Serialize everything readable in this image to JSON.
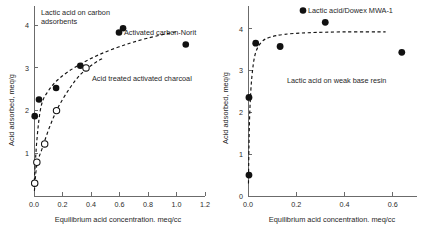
{
  "figure": {
    "panel_count": 2
  },
  "chart_data": [
    {
      "type": "scatter",
      "id": "left-panel",
      "title": "",
      "annotations": [
        {
          "id": "panel-title",
          "text_line1": "Lactic acid on carbon",
          "text_line2": "adsorbents"
        },
        {
          "id": "series-norit-label",
          "text": "Activated carbon-Norit"
        },
        {
          "id": "series-charcoal-label",
          "text": "Acid treated activated charcoal"
        }
      ],
      "xlabel": "Equilibrium acid concentration. meq/cc",
      "ylabel": "Acid adsorbed, meq/g",
      "xlim": [
        0.0,
        1.2
      ],
      "ylim": [
        0.0,
        4.45
      ],
      "xticks": [
        0.0,
        0.2,
        0.4,
        0.6,
        0.8,
        1.0,
        1.2
      ],
      "xticklabels": [
        "0.0",
        "0.2",
        "0.4",
        "0.6",
        "0.8",
        "1.0",
        "1.2"
      ],
      "yticks": [
        1,
        2,
        3,
        4
      ],
      "yticklabels": [
        "1",
        "2",
        "3",
        "4"
      ],
      "grid": false,
      "legend": "annotation-labels",
      "series": [
        {
          "name": "Activated carbon-Norit",
          "marker": "filled-circle",
          "color": "#111111",
          "points": [
            {
              "x": 0.005,
              "y": 0.3
            },
            {
              "x": 0.005,
              "y": 1.87
            },
            {
              "x": 0.035,
              "y": 2.26
            },
            {
              "x": 0.155,
              "y": 2.53
            },
            {
              "x": 0.325,
              "y": 3.05
            },
            {
              "x": 0.625,
              "y": 3.93
            },
            {
              "x": 1.065,
              "y": 3.55
            }
          ],
          "fit_curve": [
            {
              "x": 0.0,
              "y": 0.22
            },
            {
              "x": 0.02,
              "y": 1.3
            },
            {
              "x": 0.05,
              "y": 2.1
            },
            {
              "x": 0.1,
              "y": 2.46
            },
            {
              "x": 0.18,
              "y": 2.76
            },
            {
              "x": 0.3,
              "y": 3.04
            },
            {
              "x": 0.45,
              "y": 3.3
            },
            {
              "x": 0.62,
              "y": 3.52
            },
            {
              "x": 0.8,
              "y": 3.7
            },
            {
              "x": 1.0,
              "y": 3.85
            }
          ]
        },
        {
          "name": "Acid treated activated charcoal",
          "marker": "open-circle",
          "color": "#111111",
          "points": [
            {
              "x": 0.005,
              "y": 0.3
            },
            {
              "x": 0.02,
              "y": 0.79
            },
            {
              "x": 0.075,
              "y": 1.22
            },
            {
              "x": 0.158,
              "y": 2.0
            },
            {
              "x": 0.365,
              "y": 3.0
            }
          ],
          "fit_curve": [
            {
              "x": 0.003,
              "y": 0.12
            },
            {
              "x": 0.02,
              "y": 0.72
            },
            {
              "x": 0.06,
              "y": 1.14
            },
            {
              "x": 0.11,
              "y": 1.62
            },
            {
              "x": 0.17,
              "y": 2.08
            },
            {
              "x": 0.25,
              "y": 2.52
            },
            {
              "x": 0.33,
              "y": 2.86
            },
            {
              "x": 0.42,
              "y": 3.1
            },
            {
              "x": 0.48,
              "y": 3.22
            }
          ]
        }
      ]
    },
    {
      "type": "scatter",
      "id": "right-panel",
      "title": "",
      "annotations": [
        {
          "id": "series-dowex-label",
          "text": "Lactic acid/Dowex MWA-1"
        },
        {
          "id": "panel-subtitle",
          "text": "Lactic acid on weak base resin"
        }
      ],
      "xlabel": "Equilibrium acid concentration. meq/cc",
      "ylabel": "Acid adsorbed, meq/g",
      "xlim": [
        0.0,
        0.7
      ],
      "ylim": [
        0.0,
        4.55
      ],
      "xticks": [
        0.0,
        0.2,
        0.4,
        0.6
      ],
      "xticklabels": [
        "0.0",
        "0.2",
        "0.4",
        "0.6"
      ],
      "yticks": [
        0,
        1,
        2,
        3,
        4
      ],
      "yticklabels": [
        "0",
        "1",
        "2",
        "3",
        "4"
      ],
      "grid": false,
      "legend": "annotation-labels",
      "series": [
        {
          "name": "Lactic acid/Dowex MWA-1",
          "marker": "filled-circle",
          "color": "#111111",
          "points": [
            {
              "x": 0.004,
              "y": 0.5
            },
            {
              "x": 0.004,
              "y": 2.36
            },
            {
              "x": 0.032,
              "y": 3.66
            },
            {
              "x": 0.133,
              "y": 3.58
            },
            {
              "x": 0.32,
              "y": 4.16
            },
            {
              "x": 0.637,
              "y": 3.44
            }
          ],
          "fit_curve": [
            {
              "x": 0.002,
              "y": 0.3
            },
            {
              "x": 0.004,
              "y": 1.2
            },
            {
              "x": 0.008,
              "y": 2.1
            },
            {
              "x": 0.016,
              "y": 2.85
            },
            {
              "x": 0.03,
              "y": 3.4
            },
            {
              "x": 0.055,
              "y": 3.68
            },
            {
              "x": 0.09,
              "y": 3.8
            },
            {
              "x": 0.15,
              "y": 3.87
            },
            {
              "x": 0.25,
              "y": 3.91
            },
            {
              "x": 0.4,
              "y": 3.93
            },
            {
              "x": 0.57,
              "y": 3.93
            }
          ]
        }
      ]
    }
  ]
}
